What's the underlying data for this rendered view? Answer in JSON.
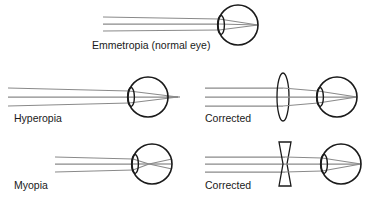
{
  "figure": {
    "background_color": "#ffffff",
    "width": 387,
    "height": 199
  },
  "colors": {
    "outline": "#1a1a1a",
    "ray": "#8a8a8a",
    "text": "#1a1a1a",
    "background": "#ffffff"
  },
  "panels": [
    {
      "id": "emmetropia",
      "label": "Emmetropia (normal eye)",
      "row": 1,
      "column": "center",
      "condition": "normal",
      "corrective_lens": "none",
      "focal_point": "on retina",
      "ray_count": 3
    },
    {
      "id": "hyperopia",
      "label": "Hyperopia",
      "row": 2,
      "column": "left",
      "condition": "farsighted",
      "corrective_lens": "none",
      "focal_point": "behind retina",
      "ray_count": 3
    },
    {
      "id": "hyperopia-corrected",
      "label": "Corrected",
      "row": 2,
      "column": "right",
      "condition": "farsighted",
      "corrective_lens": "convex",
      "focal_point": "on retina",
      "ray_count": 3
    },
    {
      "id": "myopia",
      "label": "Myopia",
      "row": 3,
      "column": "left",
      "condition": "nearsighted",
      "corrective_lens": "none",
      "focal_point": "in front of retina",
      "ray_count": 3
    },
    {
      "id": "myopia-corrected",
      "label": "Corrected",
      "row": 3,
      "column": "right",
      "condition": "nearsighted",
      "corrective_lens": "concave",
      "focal_point": "on retina",
      "ray_count": 3
    }
  ],
  "labels": {
    "emmetropia": "Emmetropia (normal eye)",
    "hyperopia": "Hyperopia",
    "hyperopia_corrected": "Corrected",
    "myopia": "Myopia",
    "myopia_corrected": "Corrected"
  }
}
